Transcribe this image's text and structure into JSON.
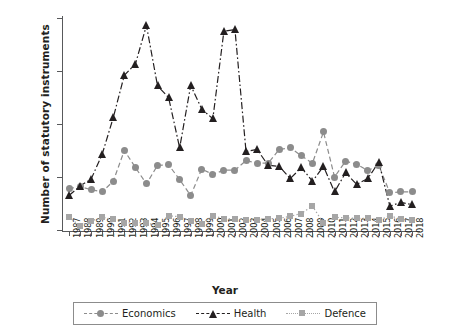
{
  "chart_data": {
    "type": "line",
    "title": "",
    "xlabel": "Year",
    "ylabel": "Number of statutory instruments",
    "xlim": [
      1987,
      2018
    ],
    "ylim": [
      0,
      400
    ],
    "yticks": [
      0,
      100,
      200,
      300,
      400
    ],
    "grid": false,
    "legend_position": "bottom",
    "categories": [
      "1987",
      "1988",
      "1989",
      "1990",
      "1991",
      "1992",
      "1993",
      "1994",
      "1995",
      "1996",
      "1997",
      "1998",
      "1999",
      "2000",
      "2001",
      "2002",
      "2003",
      "2004",
      "2005",
      "2006",
      "2007",
      "2008",
      "2009",
      "2010",
      "2011",
      "2012",
      "2013",
      "2014",
      "2015",
      "2016",
      "2017",
      "2018"
    ],
    "series": [
      {
        "name": "Economics",
        "color": "#8c8c8c",
        "marker": "circle",
        "linestyle": "dashed",
        "values": [
          78,
          82,
          76,
          72,
          92,
          150,
          118,
          87,
          122,
          123,
          95,
          65,
          115,
          105,
          113,
          113,
          131,
          126,
          126,
          152,
          155,
          140,
          126,
          185,
          100,
          130,
          124,
          112,
          122,
          70,
          72,
          72
        ]
      },
      {
        "name": "Health",
        "color": "#231f20",
        "marker": "triangle",
        "linestyle": "dashdot",
        "values": [
          65,
          83,
          96,
          143,
          212,
          292,
          313,
          386,
          272,
          250,
          155,
          273,
          228,
          210,
          375,
          378,
          148,
          152,
          122,
          120,
          97,
          118,
          92,
          120,
          72,
          108,
          86,
          97,
          128,
          45,
          52,
          48
        ]
      },
      {
        "name": "Defence",
        "color": "#a6a6a6",
        "marker": "square",
        "linestyle": "dotted",
        "values": [
          24,
          8,
          17,
          24,
          20,
          13,
          14,
          13,
          9,
          27,
          25,
          17,
          12,
          27,
          21,
          21,
          18,
          19,
          21,
          22,
          26,
          31,
          45,
          13,
          24,
          23,
          22,
          22,
          18,
          27,
          20,
          18
        ]
      }
    ]
  },
  "axes": {
    "ylabel": "Number of statutory instruments",
    "xlabel": "Year",
    "ytick_labels": [
      "400",
      "300",
      "200",
      "100",
      "0"
    ]
  },
  "legend": {
    "items": [
      {
        "label": "Economics",
        "marker": "circle-marker",
        "color": "#8c8c8c"
      },
      {
        "label": "Health",
        "marker": "triangle-marker",
        "color": "#231f20"
      },
      {
        "label": "Defence",
        "marker": "square-marker",
        "color": "#a6a6a6"
      }
    ]
  }
}
